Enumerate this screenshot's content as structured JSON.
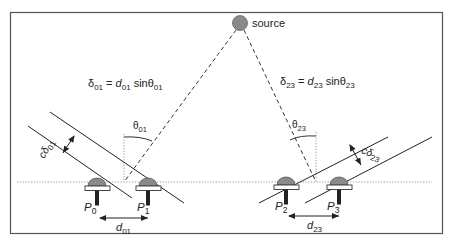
{
  "diagram": {
    "type": "sensor-array-time-difference-of-arrival",
    "source": {
      "label": "source"
    },
    "equations": {
      "left": {
        "delta": "δ",
        "delta_sub": "01",
        "eq": " = ",
        "d": "d",
        "d_sub": "01",
        "sin": " sinθ",
        "theta_sub": "01"
      },
      "right": {
        "delta": "δ",
        "delta_sub": "23",
        "eq": " = ",
        "d": "d",
        "d_sub": "23",
        "sin": " sinθ",
        "theta_sub": "23"
      }
    },
    "angles": {
      "left": {
        "symbol": "θ",
        "sub": "01"
      },
      "right": {
        "symbol": "θ",
        "sub": "23"
      }
    },
    "path_differences": {
      "left": {
        "prefix": "cδ",
        "sub": "01"
      },
      "right": {
        "prefix": "cδ",
        "sub": "23"
      }
    },
    "sensors": [
      {
        "name": "P",
        "sub": "0"
      },
      {
        "name": "P",
        "sub": "1"
      },
      {
        "name": "P",
        "sub": "2"
      },
      {
        "name": "P",
        "sub": "3"
      }
    ],
    "spacings": {
      "left": {
        "name": "d",
        "sub": "01"
      },
      "right": {
        "name": "d",
        "sub": "23"
      }
    },
    "colors": {
      "frame": "#444444",
      "line": "#222222",
      "sensor_dome": "#8a8a8a",
      "sensor_pin": "#222222",
      "dotted": "#999999"
    }
  }
}
